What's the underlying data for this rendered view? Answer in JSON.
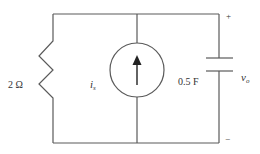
{
  "diagram": {
    "type": "circuit",
    "components": {
      "resistor": {
        "label": "2 Ω"
      },
      "current_source": {
        "label": "i",
        "label_sub": "s",
        "direction": "up"
      },
      "capacitor": {
        "label": "0.5 F"
      },
      "output_voltage": {
        "label": "v",
        "label_sub": "o",
        "plus": "+",
        "minus": "−"
      }
    },
    "colors": {
      "wire": "#5a5a5a",
      "text": "#333333",
      "background": "#ffffff"
    }
  }
}
